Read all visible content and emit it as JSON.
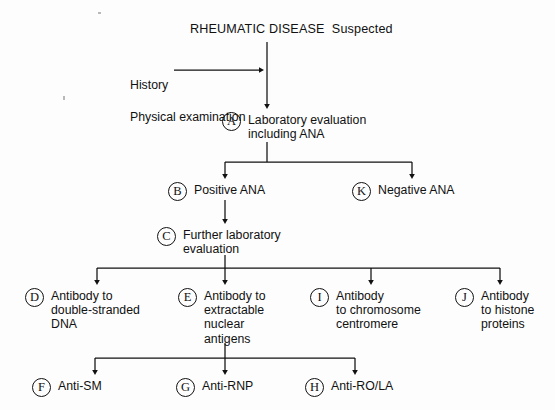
{
  "figure": {
    "kind": "clinical-decision-flowchart",
    "title": "RHEUMATIC DISEASE  Suspected",
    "background_color": "#fdfdfd",
    "line_color": "#111111",
    "text_color": "#111111"
  },
  "side_note": {
    "line1": "History",
    "line2": "Physical examination"
  },
  "nodes": [
    {
      "id": "A",
      "badge": "A",
      "label": "Laboratory evaluation\nincluding ANA"
    },
    {
      "id": "B",
      "badge": "B",
      "label": "Positive ANA"
    },
    {
      "id": "K",
      "badge": "K",
      "label": "Negative ANA"
    },
    {
      "id": "C",
      "badge": "C",
      "label": "Further laboratory\nevaluation"
    },
    {
      "id": "D",
      "badge": "D",
      "label": "Antibody to\ndouble-stranded\nDNA"
    },
    {
      "id": "E",
      "badge": "E",
      "label": "Antibody to\nextractable\nnuclear\nantigens"
    },
    {
      "id": "I",
      "badge": "I",
      "label": "Antibody\nto chromosome\ncentromere"
    },
    {
      "id": "J",
      "badge": "J",
      "label": "Antibody\nto histone\nproteins"
    },
    {
      "id": "F",
      "badge": "F",
      "label": "Anti-SM"
    },
    {
      "id": "G",
      "badge": "G",
      "label": "Anti-RNP"
    },
    {
      "id": "H",
      "badge": "H",
      "label": "Anti-RO/LA"
    }
  ],
  "edges": [
    {
      "from": "title",
      "to": "A",
      "style": "vertical-arrow"
    },
    {
      "from": "side_note",
      "to": "spine",
      "style": "horizontal-arrow"
    },
    {
      "from": "A",
      "to": "B",
      "style": "branch-arrow"
    },
    {
      "from": "A",
      "to": "K",
      "style": "branch-arrow"
    },
    {
      "from": "B",
      "to": "C",
      "style": "vertical-arrow"
    },
    {
      "from": "C",
      "to": "D",
      "style": "branch-arrow"
    },
    {
      "from": "C",
      "to": "E",
      "style": "branch-arrow"
    },
    {
      "from": "C",
      "to": "I",
      "style": "branch-arrow"
    },
    {
      "from": "C",
      "to": "J",
      "style": "branch-arrow"
    },
    {
      "from": "E",
      "to": "F",
      "style": "branch-arrow"
    },
    {
      "from": "E",
      "to": "G",
      "style": "branch-arrow"
    },
    {
      "from": "E",
      "to": "H",
      "style": "branch-arrow"
    }
  ]
}
